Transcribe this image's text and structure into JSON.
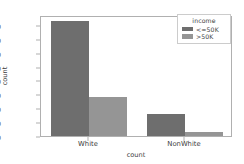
{
  "chart_data": {
    "type": "bar",
    "title": "",
    "xlabel": "count",
    "ylabel": "count",
    "categories": [
      "White",
      "NonWhite"
    ],
    "series": [
      {
        "name": "<=50K",
        "values": [
          20700,
          4000
        ],
        "color": "#6e6e6e"
      },
      {
        "name": ">50K",
        "values": [
          7100,
          800
        ],
        "color": "#959595"
      }
    ],
    "ylim": [
      0,
      21800
    ],
    "yticks": [
      0,
      2500,
      5000,
      7500,
      10000,
      12500,
      15000,
      17500,
      20000
    ],
    "ytick_labels": [
      "0",
      "2500",
      "5000",
      "7500",
      "10000",
      "12500",
      "15000",
      "17500",
      "20000"
    ],
    "grid": false,
    "legend": {
      "title": "income",
      "position": "upper right",
      "entries": [
        "<=50K",
        ">50K"
      ]
    }
  }
}
